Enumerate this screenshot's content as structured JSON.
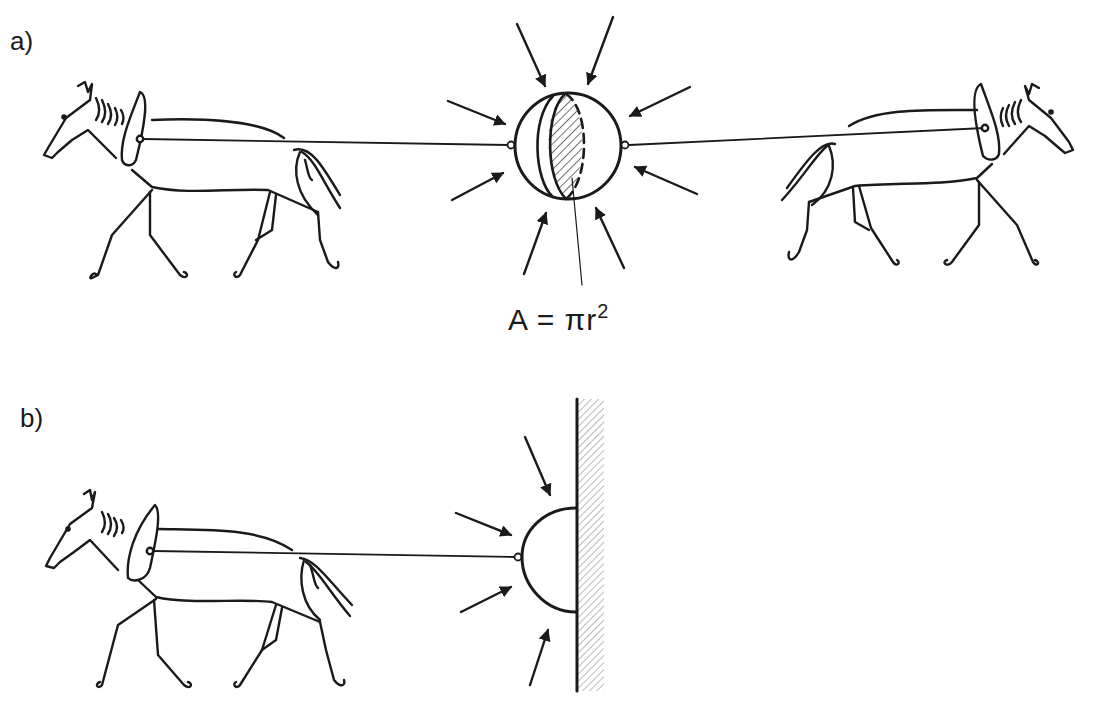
{
  "figure": {
    "panels": [
      {
        "label": "a)",
        "description": "Two horses pulling in opposite directions on two evacuated hemispheres (Magdeburg hemispheres); atmospheric pressure arrows press on the sphere",
        "formula": {
          "lhs": "A = πr",
          "exponent": "2"
        }
      },
      {
        "label": "b)",
        "description": "One horse pulling a single hemisphere fixed against a wall; same result as two horses"
      }
    ],
    "colors": {
      "ink": "#1a1a1a",
      "background": "#ffffff",
      "hatch": "#555555"
    }
  }
}
